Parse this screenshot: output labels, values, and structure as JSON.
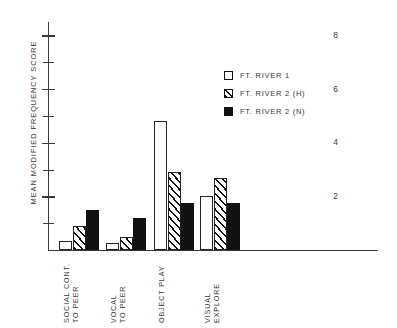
{
  "chart_data": {
    "type": "bar",
    "title": "",
    "xlabel": "",
    "ylabel": "MEAN MODIFIED FREQUENCY SCORE",
    "ylim": [
      0,
      8.5
    ],
    "grid": false,
    "legend_position": "upper-right-inside",
    "y_major_ticks": [
      2,
      4,
      6,
      8
    ],
    "y_minor_ticks": [
      1,
      3,
      5,
      7
    ],
    "y_ticklabels": [
      "2",
      "4",
      "6",
      "8"
    ],
    "categories": [
      "SOCIAL CONT.\nTO PEER",
      "VOCAL\nTO PEER",
      "OBJECT PLAY",
      "VISUAL\nEXPLORE"
    ],
    "category_lines": [
      [
        "SOCIAL CONT.",
        "TO PEER"
      ],
      [
        "VOCAL",
        "TO PEER"
      ],
      [
        "OBJECT PLAY",
        ""
      ],
      [
        "VISUAL",
        "EXPLORE"
      ]
    ],
    "series": [
      {
        "name": "FT. RIVER 1",
        "fill": "white",
        "values": [
          0.35,
          0.25,
          4.8,
          2.0
        ]
      },
      {
        "name": "FT. RIVER 2 (H)",
        "fill": "hatch",
        "values": [
          0.9,
          0.5,
          2.9,
          2.7
        ]
      },
      {
        "name": "FT. RIVER 2 (N)",
        "fill": "solid",
        "values": [
          1.5,
          1.2,
          1.75,
          1.75
        ]
      }
    ]
  },
  "legend": {
    "items": [
      {
        "label": "FT. RIVER 1"
      },
      {
        "label": "FT. RIVER 2 (H)"
      },
      {
        "label": "FT. RIVER 2 (N)"
      }
    ]
  },
  "colors": {
    "axis": "#3a3a3a",
    "bar_outline": "#222222",
    "bar_solid": "#111111",
    "background": "#ffffff"
  }
}
